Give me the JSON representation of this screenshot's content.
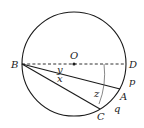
{
  "diagram": {
    "type": "circle-geometry",
    "colors": {
      "stroke": "#1a1a1a",
      "text": "#222222",
      "background": "#ffffff"
    },
    "circle": {
      "center": "O",
      "cx": 74,
      "cy": 64,
      "r": 52
    },
    "points": {
      "O": {
        "label": "O",
        "x": 74,
        "y": 64
      },
      "B": {
        "label": "B",
        "x": 22,
        "y": 64
      },
      "D": {
        "label": "D",
        "x": 126,
        "y": 64
      },
      "A": {
        "label": "A",
        "x": 120,
        "y": 89
      },
      "C": {
        "label": "C",
        "x": 100,
        "y": 109
      }
    },
    "segments": [
      {
        "from": "B",
        "to": "D",
        "style": "dashed",
        "name": "diameter"
      },
      {
        "from": "B",
        "to": "A",
        "style": "solid"
      },
      {
        "from": "B",
        "to": "C",
        "style": "solid"
      }
    ],
    "angle_labels": {
      "y": "y",
      "x": "x",
      "z": "z"
    },
    "arc_labels": {
      "p": "p",
      "q": "q"
    }
  }
}
